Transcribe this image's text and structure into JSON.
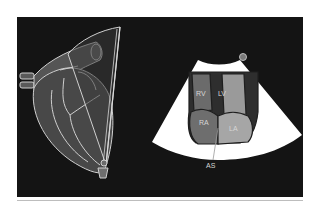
{
  "figure": {
    "type": "echocardiography illustration",
    "left_view": "heart anatomy with transducer imaging plane",
    "right_view": "ultrasound sector view of the heart chambers"
  },
  "labels": {
    "rv": "RV",
    "lv": "LV",
    "ra": "RA",
    "la": "LA",
    "as": "AS"
  },
  "colors": {
    "background": "#141414",
    "sector": "#ffffff",
    "rv": "#6b6b6b",
    "lv": "#9a9a9a",
    "ra": "#6e6e6e",
    "la": "#a6a6a6",
    "septum": "#3a3a3a",
    "outline": "#cfcfcf",
    "heart_fill": "#4a4a4a",
    "probe": "#7a7a7a"
  }
}
